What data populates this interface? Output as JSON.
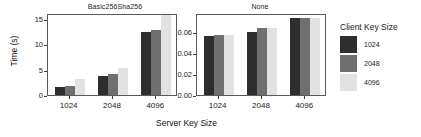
{
  "chart_data": {
    "type": "bar",
    "title": "",
    "xlabel": "Server Key Size",
    "ylabel": "Time (s)",
    "legend_title": "Client Key Size",
    "legend_position": "right",
    "grid": false,
    "categories": [
      "1024",
      "2048",
      "4096"
    ],
    "panels": [
      {
        "title": "Basic256Sha256",
        "ylim": [
          0,
          16.2
        ],
        "yticks": [
          0,
          5,
          10,
          15
        ],
        "ytick_labels": [
          "0",
          "5",
          "10",
          "15"
        ],
        "series": [
          {
            "name": "1024",
            "color": "#2e2e2e",
            "values": [
              1.5,
              3.8,
              12.4
            ]
          },
          {
            "name": "2048",
            "color": "#6f6f6f",
            "values": [
              1.7,
              4.2,
              12.8
            ]
          },
          {
            "name": "4096",
            "color": "#e2e2e2",
            "values": [
              3.1,
              5.4,
              18.0
            ]
          }
        ]
      },
      {
        "title": "None",
        "ylim": [
          0,
          0.0775
        ],
        "yticks": [
          0,
          0.02,
          0.04,
          0.06
        ],
        "ytick_labels": [
          "0.00",
          "0.02",
          "0.04",
          "0.06"
        ],
        "series": [
          {
            "name": "1024",
            "color": "#2e2e2e",
            "values": [
              0.0555,
              0.06,
              0.073
            ]
          },
          {
            "name": "2048",
            "color": "#6f6f6f",
            "values": [
              0.0568,
              0.063,
              0.073
            ]
          },
          {
            "name": "4096",
            "color": "#e2e2e2",
            "values": [
              0.0568,
              0.0635,
              0.073
            ]
          }
        ]
      }
    ],
    "legend_entries": [
      {
        "label": "1024",
        "color": "#2e2e2e"
      },
      {
        "label": "2048",
        "color": "#6f6f6f"
      },
      {
        "label": "4096",
        "color": "#e2e2e2"
      }
    ]
  }
}
